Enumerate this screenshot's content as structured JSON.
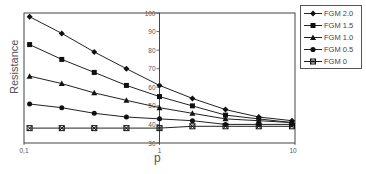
{
  "chart_data": {
    "type": "line",
    "title": "",
    "xlabel": "p",
    "ylabel": "Resistance",
    "xscale": "log",
    "xlim": [
      0.1,
      10
    ],
    "ylim": [
      30,
      100
    ],
    "x_tick_labels": [
      "0,1",
      "1",
      "10"
    ],
    "y_tick_labels": [
      "30",
      "40",
      "50",
      "60",
      "70",
      "80",
      "90",
      "100"
    ],
    "y_axis_position": "crosses at p = 1",
    "grid": false,
    "legend_position": "right",
    "x": [
      0.11,
      0.19,
      0.33,
      0.57,
      1.0,
      1.75,
      3.07,
      5.4,
      9.5
    ],
    "series": [
      {
        "name": "FGM 2.0",
        "marker": "diamond",
        "values": [
          98,
          89,
          79,
          70,
          61,
          54,
          48,
          44,
          42
        ]
      },
      {
        "name": "FGM 1.5",
        "marker": "square",
        "values": [
          83,
          75,
          68,
          61,
          55,
          50,
          45,
          43,
          41
        ]
      },
      {
        "name": "FGM 1.0",
        "marker": "triangle",
        "values": [
          66,
          62,
          57,
          53,
          49,
          46,
          43,
          42,
          41
        ]
      },
      {
        "name": "FGM 0.5",
        "marker": "circle",
        "values": [
          51,
          49,
          46,
          44,
          43,
          42,
          40,
          40,
          40
        ]
      },
      {
        "name": "FGM 0",
        "marker": "x-square",
        "values": [
          38,
          38,
          38,
          38,
          38,
          39,
          39,
          39,
          39
        ]
      }
    ]
  },
  "legend": {
    "items": [
      "FGM 2.0",
      "FGM 1.5",
      "FGM 1.0",
      "FGM 0.5",
      "FGM 0"
    ]
  }
}
